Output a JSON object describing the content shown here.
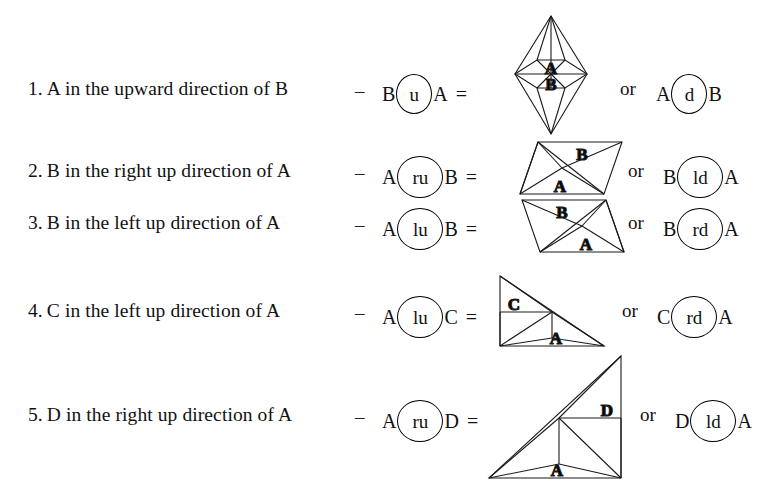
{
  "document": {
    "title": "Spatial direction relations between regions"
  },
  "rows": [
    {
      "number": "1.",
      "description": "A in the upward direction of B",
      "dash": "–",
      "expr_left_operand": "B",
      "expr_operator": "u",
      "expr_right_operand": "A",
      "equals": "=",
      "or_word": "or",
      "alt_left_operand": "A",
      "alt_operator": "d",
      "alt_right_operand": "B",
      "figure_name": "bipyramid-a-over-b",
      "figure_labels": [
        "A",
        "B"
      ]
    },
    {
      "number": "2.",
      "description": "B in the right up direction of A",
      "dash": "–",
      "expr_left_operand": "A",
      "expr_operator": "ru",
      "expr_right_operand": "B",
      "equals": "=",
      "or_word": "or",
      "alt_left_operand": "B",
      "alt_operator": "ld",
      "alt_right_operand": "A",
      "figure_name": "parallelogram-b-right-up-of-a",
      "figure_labels": [
        "B",
        "A"
      ]
    },
    {
      "number": "3.",
      "description": "B in the left up direction of A",
      "dash": "–",
      "expr_left_operand": "A",
      "expr_operator": "lu",
      "expr_right_operand": "B",
      "equals": "=",
      "or_word": "or",
      "alt_left_operand": "B",
      "alt_operator": "rd",
      "alt_right_operand": "A",
      "figure_name": "parallelogram-b-left-up-of-a",
      "figure_labels": [
        "B",
        "A"
      ]
    },
    {
      "number": "4.",
      "description": "C in the left up direction of A",
      "dash": "–",
      "expr_left_operand": "A",
      "expr_operator": "lu",
      "expr_right_operand": "C",
      "equals": "=",
      "or_word": "or",
      "alt_left_operand": "C",
      "alt_operator": "rd",
      "alt_right_operand": "A",
      "figure_name": "right-triangle-c-left-up-of-a",
      "figure_labels": [
        "C",
        "A"
      ]
    },
    {
      "number": "5.",
      "description": "D in the right up direction of A",
      "dash": "–",
      "expr_left_operand": "A",
      "expr_operator": "ru",
      "expr_right_operand": "D",
      "equals": "=",
      "or_word": "or",
      "alt_left_operand": "D",
      "alt_operator": "ld",
      "alt_right_operand": "A",
      "figure_name": "right-triangle-d-right-up-of-a",
      "figure_labels": [
        "D",
        "A"
      ]
    }
  ],
  "colors": {
    "ink": "#000000",
    "background": "#ffffff",
    "stroke": "#1a1a1a"
  }
}
